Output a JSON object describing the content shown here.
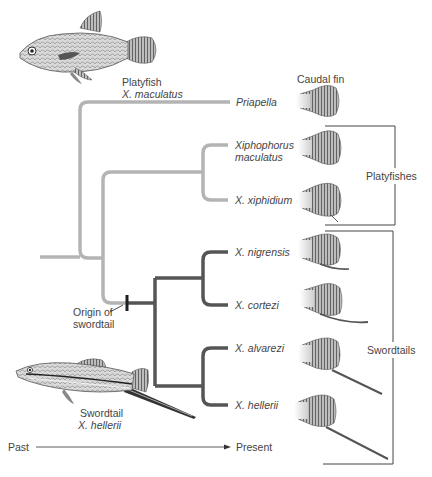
{
  "figure": {
    "type": "phylogenetic-tree",
    "topic": "Evolution of the swordtail caudal fin in Xiphophorus"
  },
  "illustrations": {
    "platyfish": {
      "common_name": "Platyfish",
      "species": "X. maculatus"
    },
    "swordtail": {
      "common_name": "Swordtail",
      "species": "X. hellerii"
    }
  },
  "column_header": {
    "caudal_fin": "Caudal fin"
  },
  "taxa": [
    {
      "name": "Priapella",
      "group": "outgroup",
      "fin": "round"
    },
    {
      "name_line1": "Xiphophorus",
      "name_line2": "maculatus",
      "group": "Platyfishes",
      "fin": "round"
    },
    {
      "name": "X. xiphidium",
      "group": "Platyfishes",
      "fin": "round-small-point"
    },
    {
      "name": "X. nigrensis",
      "group": "Swordtails",
      "fin": "short-sword"
    },
    {
      "name": "X. cortezi",
      "group": "Swordtails",
      "fin": "medium-sword"
    },
    {
      "name": "X. alvarezi",
      "group": "Swordtails",
      "fin": "long-sword"
    },
    {
      "name": "X. hellerii",
      "group": "Swordtails",
      "fin": "long-sword"
    }
  ],
  "brackets": {
    "platyfishes": "Platyfishes",
    "swordtails": "Swordtails"
  },
  "annotation": {
    "origin_line1": "Origin of",
    "origin_line2": "swordtail"
  },
  "time_axis": {
    "start": "Past",
    "end": "Present"
  },
  "colors": {
    "platy_lineage": "#b4b4b4",
    "swordtail_lineage": "#555555",
    "bracket": "#444444",
    "text": "#444444"
  }
}
